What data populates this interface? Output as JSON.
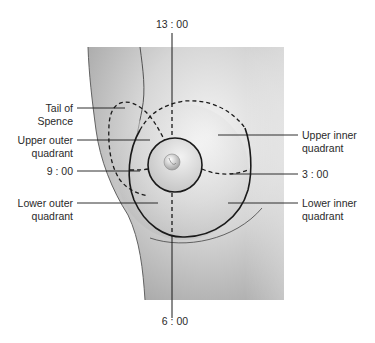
{
  "diagram": {
    "labels": {
      "top_clock": "13 : 00",
      "bottom_clock": "6 : 00",
      "left_clock": "9 : 00",
      "right_clock": "3 : 00",
      "tail_of_spence": [
        "Tail of",
        "Spence"
      ],
      "upper_outer": [
        "Upper outer",
        "quadrant"
      ],
      "lower_outer": [
        "Lower outer",
        "quadrant"
      ],
      "upper_inner": [
        "Upper inner",
        "quadrant"
      ],
      "lower_inner": [
        "Lower inner",
        "quadrant"
      ]
    },
    "colors": {
      "skin_light": "#ececec",
      "skin_dark": "#9a9a9a",
      "line": "#1a1a1a",
      "text": "#2a2a2a"
    }
  }
}
